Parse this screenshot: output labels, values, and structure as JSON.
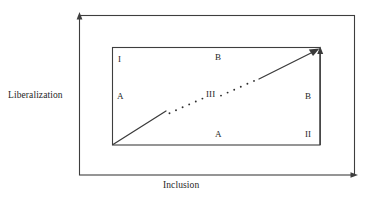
{
  "figure": {
    "type": "conceptual-diagram",
    "axes": {
      "y_label": "Liberalization",
      "x_label": "Inclusion"
    },
    "zones": [
      {
        "id": "quadrant-I",
        "label": "I",
        "position": "inner-top-left"
      },
      {
        "id": "path-B-top",
        "label": "B",
        "position": "inner-top-center"
      },
      {
        "id": "path-A-left",
        "label": "A",
        "position": "inner-left-center"
      },
      {
        "id": "path-III",
        "label": "III",
        "position": "inner-center"
      },
      {
        "id": "path-B-right",
        "label": "B",
        "position": "inner-right-center"
      },
      {
        "id": "path-A-bottom",
        "label": "A",
        "position": "inner-bottom-center"
      },
      {
        "id": "quadrant-II",
        "label": "II",
        "position": "inner-bottom-right"
      }
    ],
    "colors": {
      "stroke": "#3a3a3a",
      "text": "#262626",
      "background": "#ffffff"
    },
    "geometry": {
      "outer_frame": {
        "x1": 79,
        "y1": 15,
        "x2": 355,
        "y2": 175
      },
      "inner_frame": {
        "x1": 112,
        "y1": 47,
        "x2": 320,
        "y2": 145
      },
      "diagonal_arrow": {
        "from_x": 112,
        "from_y": 145,
        "to_x": 318,
        "to_y": 50,
        "style": "solid-dotted-solid"
      },
      "vertical_arrow": {
        "x": 320,
        "from_y": 145,
        "to_y": 48,
        "style": "solid"
      }
    }
  }
}
